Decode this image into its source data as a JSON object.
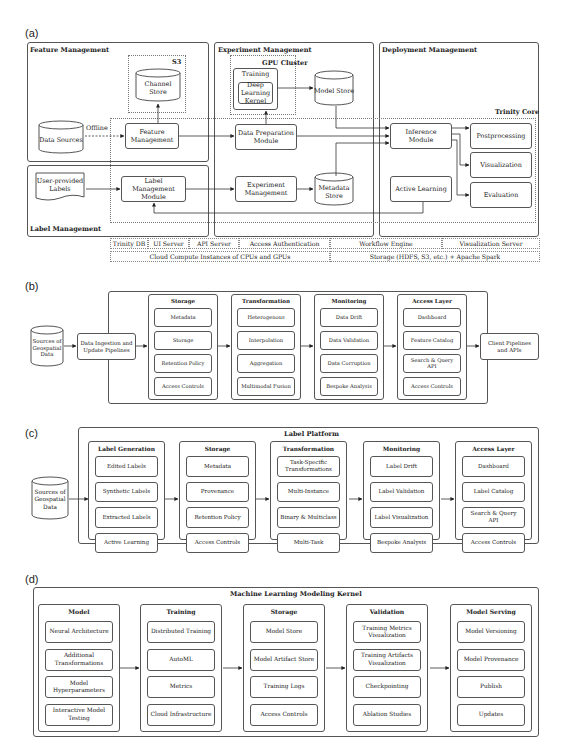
{
  "panels": {
    "a": {
      "label": "(a)",
      "feature_management": {
        "title": "Feature Management",
        "s3": "S3",
        "channel_store": "Channel Store",
        "data_sources": "Data Sources",
        "offline": "Offline",
        "feature_module": "Feature Management"
      },
      "label_management": {
        "title": "Label Management",
        "user_labels": "User-provided Labels",
        "label_module": "Label Management Module"
      },
      "experiment_management": {
        "title": "Experiment Management",
        "gpu_cluster": "GPU Cluster",
        "training": "Training",
        "dl_kernel": "Deep Learning Kernel",
        "model_store": "Model Store",
        "data_prep": "Data Preparation Module",
        "experiment": "Experiment Management",
        "metadata_store": "Metadata Store"
      },
      "deployment_management": {
        "title": "Deployment Management",
        "trinity_core": "Trinity Core",
        "inference": "Inference Module",
        "postprocessing": "Postprocessing",
        "visualization": "Visualization",
        "evaluation": "Evaluation",
        "active_learning": "Active Learning"
      },
      "infra_row1": [
        "Trinity DB",
        "UI Server",
        "API Server",
        "Access Authentication",
        "Workflow Engine",
        "Visualization Server"
      ],
      "infra_row2": [
        "Cloud Compute Instances of CPUs and GPUs",
        "Storage (HDFS, S3, etc.) + Apache Spark"
      ]
    },
    "b": {
      "label": "(b)",
      "source": "Sources of Geospatial Data",
      "ingestion": "Data Ingestion and Update Pipelines",
      "client": "Client Pipelines and APIs",
      "columns": [
        {
          "title": "Storage",
          "items": [
            "Metadata",
            "Storage",
            "Retention Policy",
            "Access Controls"
          ]
        },
        {
          "title": "Transformation",
          "items": [
            "Heterogenous",
            "Interpolation",
            "Aggregation",
            "Multimodal Fusion"
          ]
        },
        {
          "title": "Monitoring",
          "items": [
            "Data Drift",
            "Data Validation",
            "Data Corruption",
            "Bespoke Analysis"
          ]
        },
        {
          "title": "Access Layer",
          "items": [
            "Dashboard",
            "Feature Catalog",
            "Search & Query API",
            "Access Controls"
          ]
        }
      ]
    },
    "c": {
      "label": "(c)",
      "title": "Label Platform",
      "source": "Sources of Geospatial Data",
      "columns": [
        {
          "title": "Label Generation",
          "items": [
            "Edited Labels",
            "Synthetic Labels",
            "Extracted Labels",
            "Active Learning"
          ]
        },
        {
          "title": "Storage",
          "items": [
            "Metadata",
            "Provenance",
            "Retention Policy",
            "Access Controls"
          ]
        },
        {
          "title": "Transformation",
          "items": [
            "Task-Specific Transformations",
            "Multi-Instance",
            "Binary & Multiclass",
            "Multi-Task"
          ]
        },
        {
          "title": "Monitoring",
          "items": [
            "Label Drift",
            "Label Validation",
            "Label Visualization",
            "Bespoke Analysis"
          ]
        },
        {
          "title": "Access Layer",
          "items": [
            "Dashboard",
            "Label Catalog",
            "Search & Query API",
            "Access Controls"
          ]
        }
      ]
    },
    "d": {
      "label": "(d)",
      "title": "Machine Learning Modeling Kernel",
      "columns": [
        {
          "title": "Model",
          "items": [
            "Neural Architecture",
            "Additional Transformations",
            "Model Hyperparameters",
            "Interactive Model Testing"
          ]
        },
        {
          "title": "Training",
          "items": [
            "Distributed Training",
            "AutoML",
            "Metrics",
            "Cloud Infrastructure"
          ]
        },
        {
          "title": "Storage",
          "items": [
            "Model Store",
            "Model Artifact Store",
            "Training Logs",
            "Access Controls"
          ]
        },
        {
          "title": "Validation",
          "items": [
            "Training Metrics Visualization",
            "Training Artifacts Visualization",
            "Checkpointing",
            "Ablation Studies"
          ]
        },
        {
          "title": "Model Serving",
          "items": [
            "Model Versioning",
            "Model Provenance",
            "Publish",
            "Updates"
          ]
        }
      ]
    }
  }
}
